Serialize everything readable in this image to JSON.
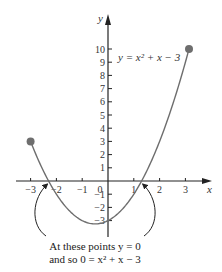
{
  "chart_data": {
    "type": "line",
    "title": "",
    "function": "y = x^2 + x - 3",
    "curve_label": "y = x² + x − 3",
    "xlabel": "x",
    "ylabel": "y",
    "xlim": [
      -3.4,
      3.9
    ],
    "ylim": [
      -4.2,
      12.5
    ],
    "x_ticks": [
      -3,
      -2,
      -1,
      0,
      1,
      2,
      3
    ],
    "x_tick_labels": [
      "−3",
      "−2",
      "−1",
      "0",
      "1",
      "2",
      "3"
    ],
    "y_ticks": [
      -3,
      -2,
      -1,
      1,
      2,
      3,
      4,
      5,
      6,
      7,
      8,
      9,
      10
    ],
    "y_tick_labels": [
      "−3",
      "−2",
      "−1",
      "1",
      "2",
      "3",
      "4",
      "5",
      "6",
      "7",
      "8",
      "9",
      "10"
    ],
    "domain": [
      -3,
      3.14
    ],
    "endpoints": [
      {
        "x": -3,
        "y": 3
      },
      {
        "x": 3.14,
        "y": 10
      }
    ],
    "roots": [
      -2.303,
      1.303
    ],
    "grid": false,
    "annotation": {
      "line1": "At these points y = 0",
      "line2": "and so 0 = x² + x − 3",
      "points_to": "roots"
    },
    "colors": {
      "curve": "#6e6e6e",
      "axis": "#222222",
      "dot": "#6e6e6e"
    }
  }
}
